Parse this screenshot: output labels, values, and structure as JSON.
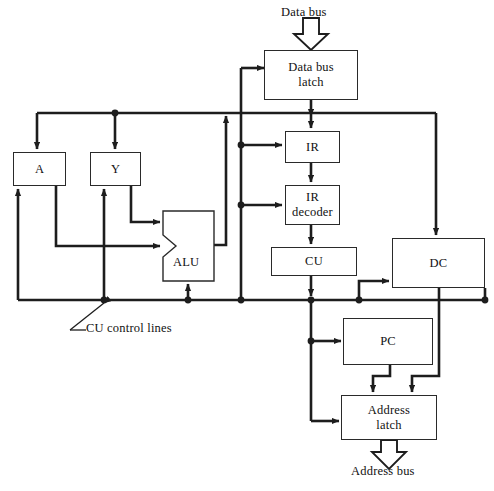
{
  "diagram": {
    "stroke_color": "#1d1d1d",
    "box_border_color": "#2a2a2a",
    "background_color": "#ffffff",
    "blocks": [
      {
        "id": "data_bus_latch",
        "label": "Data bus\nlatch",
        "line1": "Data bus",
        "line2": "latch",
        "x": 264,
        "y": 50,
        "w": 94,
        "h": 50
      },
      {
        "id": "ir",
        "label": "IR",
        "x": 285,
        "y": 131,
        "w": 55,
        "h": 32
      },
      {
        "id": "ir_decoder",
        "label": "IR\ndecoder",
        "line1": "IR",
        "line2": "decoder",
        "x": 285,
        "y": 185,
        "w": 55,
        "h": 40
      },
      {
        "id": "cu",
        "label": "CU",
        "x": 271,
        "y": 247,
        "w": 86,
        "h": 29
      },
      {
        "id": "dc",
        "label": "DC",
        "x": 392,
        "y": 238,
        "w": 93,
        "h": 50
      },
      {
        "id": "a",
        "label": "A",
        "x": 13,
        "y": 152,
        "w": 53,
        "h": 34
      },
      {
        "id": "y",
        "label": "Y",
        "x": 90,
        "y": 152,
        "w": 51,
        "h": 34
      },
      {
        "id": "alu",
        "label": "ALU",
        "x": 163,
        "y": 211,
        "w": 51,
        "h": 70
      },
      {
        "id": "pc",
        "label": "PC",
        "x": 343,
        "y": 318,
        "w": 90,
        "h": 47
      },
      {
        "id": "address_latch",
        "label": "Address\nlatch",
        "line1": "Address",
        "line2": "latch",
        "x": 341,
        "y": 395,
        "w": 96,
        "h": 45
      }
    ],
    "annotations": [
      {
        "id": "data_bus_label",
        "text": "Data bus",
        "x": 281,
        "y": 5
      },
      {
        "id": "address_bus_label",
        "text": "Address bus",
        "x": 351,
        "y": 464
      },
      {
        "id": "cu_control_lines_label",
        "text": "CU control lines",
        "x": 61,
        "y": 327
      }
    ],
    "bus_arrows": [
      {
        "id": "data-bus-in-arrow",
        "direction": "down",
        "x": 311,
        "y_top": 18,
        "y_bottom": 50
      },
      {
        "id": "address-bus-out-arrow",
        "direction": "down",
        "x": 389,
        "y_top": 440,
        "y_bottom": 463
      }
    ]
  }
}
